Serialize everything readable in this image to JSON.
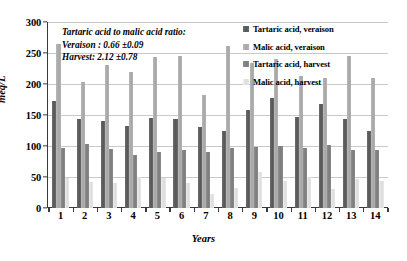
{
  "chart_data": {
    "type": "bar",
    "title": "",
    "xlabel": "Years",
    "ylabel": "meq/L",
    "ylim": [
      0,
      300
    ],
    "yticks": [
      0,
      50,
      100,
      150,
      200,
      250,
      300
    ],
    "grid": true,
    "legend_position": "top-right",
    "categories": [
      "1",
      "2",
      "3",
      "4",
      "5",
      "6",
      "7",
      "8",
      "9",
      "10",
      "11",
      "12",
      "13",
      "14"
    ],
    "series": [
      {
        "name": "Tartaric acid, veraison",
        "color": "#595959",
        "values": [
          172,
          144,
          140,
          132,
          145,
          144,
          131,
          124,
          158,
          177,
          147,
          167,
          143,
          125
        ]
      },
      {
        "name": "Malic acid, veraison",
        "color": "#a8a8a8",
        "values": [
          265,
          204,
          230,
          220,
          243,
          245,
          182,
          262,
          234,
          241,
          213,
          210,
          245,
          209
        ]
      },
      {
        "name": "Tartaric acid, harvest",
        "color": "#7e7e7e",
        "values": [
          96,
          104,
          95,
          86,
          91,
          93,
          91,
          96,
          98,
          100,
          97,
          101,
          94,
          94
        ]
      },
      {
        "name": "Malic acid, harvest",
        "color": "#dedede",
        "values": [
          48,
          42,
          40,
          50,
          49,
          41,
          22,
          33,
          58,
          44,
          50,
          30,
          47,
          44
        ]
      }
    ],
    "annotation": {
      "line1": "Tartaric acid to malic acid ratio:",
      "line2": "Veraison : 0.66  ±0.09",
      "line3": "Harvest: 2.12  ±0.78"
    }
  }
}
